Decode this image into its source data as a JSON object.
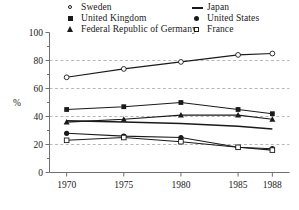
{
  "legend": {
    "columns": [
      {
        "entries": [
          {
            "label": "Sweden",
            "marker": "open-circle"
          },
          {
            "label": "United Kingdom",
            "marker": "filled-square"
          },
          {
            "label": "Federal Republic of Germany",
            "marker": "filled-triangle"
          }
        ]
      },
      {
        "entries": [
          {
            "label": "Japan",
            "marker": "line"
          },
          {
            "label": "United States",
            "marker": "filled-circle"
          },
          {
            "label": "France",
            "marker": "open-square"
          }
        ]
      }
    ]
  },
  "chart_data": {
    "type": "line",
    "title": "",
    "xlabel": "",
    "ylabel": "%",
    "x": [
      1970,
      1975,
      1980,
      1985,
      1988
    ],
    "categories": [
      "1970",
      "1975",
      "1980",
      "1985",
      "1988"
    ],
    "xlim": [
      1968.5,
      1989.5
    ],
    "ylim": [
      0,
      100
    ],
    "yticks": [
      0,
      20,
      40,
      60,
      80,
      100
    ],
    "ytick_labels": [
      "0",
      "20",
      "40",
      "60",
      "80",
      "100"
    ],
    "yminor_ticks": [
      10,
      30,
      50,
      70,
      90
    ],
    "grid": "horizontal-dashed",
    "grid_values": [
      20,
      40,
      60,
      80
    ],
    "legend_position": "above-plot",
    "series": [
      {
        "name": "Sweden",
        "marker": "open-circle",
        "values": [
          68,
          74,
          79,
          84,
          85
        ]
      },
      {
        "name": "United Kingdom",
        "marker": "filled-square",
        "values": [
          45,
          47,
          50,
          45,
          42
        ]
      },
      {
        "name": "Federal Republic of Germany",
        "marker": "filled-triangle",
        "values": [
          36,
          38,
          41,
          41,
          38
        ]
      },
      {
        "name": "Japan",
        "marker": "line",
        "values": [
          37,
          36,
          35,
          33,
          31
        ]
      },
      {
        "name": "United States",
        "marker": "filled-circle",
        "values": [
          28,
          26,
          25,
          18,
          17
        ]
      },
      {
        "name": "France",
        "marker": "open-square",
        "values": [
          23,
          25,
          22,
          18,
          16
        ]
      }
    ]
  },
  "colors": {
    "line": "#1a1a1a",
    "grid": "#9a9a9a",
    "axis": "#707070",
    "background": "#ffffff"
  }
}
